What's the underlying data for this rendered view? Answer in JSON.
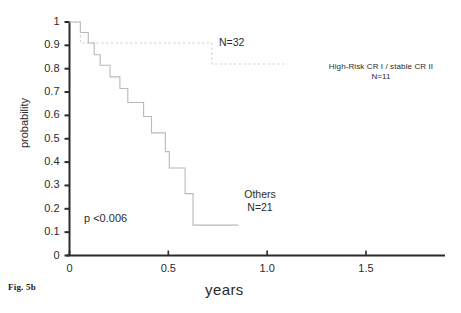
{
  "figure": {
    "caption": "Fig. 5b",
    "axes": {
      "xlabel": "years",
      "ylabel": "probability",
      "xticks": [
        "0",
        "0.5",
        "1.0",
        "1.5"
      ],
      "yticks": [
        "0",
        "0.1",
        "0.2",
        "0.3",
        "0.4",
        "0.5",
        "0.6",
        "0.7",
        "0.8",
        "0.9",
        "1"
      ]
    },
    "annotations": {
      "total_n": "N=32",
      "group_highrisk_label": "High-Risk CR I / stable CR II",
      "group_highrisk_n": "N=11",
      "group_others_label": "Others",
      "group_others_n": "N=21",
      "pvalue": "p <0.006"
    },
    "colors": {
      "axis": "#2b2b2b",
      "curve_others": "#b9b9b9",
      "curve_highrisk": "#d0d0d0",
      "rule": "#8a8a8a",
      "text": "#2b2b2b"
    }
  },
  "chart_data": {
    "type": "line",
    "subtype": "kaplan-meier-step",
    "title": "",
    "xlabel": "years",
    "ylabel": "probability",
    "xlim": [
      0,
      1.9
    ],
    "ylim": [
      0,
      1
    ],
    "grid": false,
    "legend_position": "inline-annotations",
    "xticks": [
      0,
      0.5,
      1.0,
      1.5
    ],
    "yticks": [
      0,
      0.1,
      0.2,
      0.3,
      0.4,
      0.5,
      0.6,
      0.7,
      0.8,
      0.9,
      1.0
    ],
    "pvalue": "p <0.006",
    "total_n": 32,
    "series": [
      {
        "name": "High-Risk CR I / stable CR II",
        "n": 11,
        "style": "dotted",
        "color": "#d0d0d0",
        "points": [
          [
            0.0,
            1.0
          ],
          [
            0.055,
            1.0
          ],
          [
            0.055,
            0.91
          ],
          [
            0.72,
            0.91
          ],
          [
            0.72,
            0.82
          ],
          [
            1.1,
            0.82
          ]
        ]
      },
      {
        "name": "Others",
        "n": 21,
        "style": "solid",
        "color": "#b9b9b9",
        "points": [
          [
            0.0,
            1.0
          ],
          [
            0.055,
            1.0
          ],
          [
            0.055,
            0.955
          ],
          [
            0.095,
            0.955
          ],
          [
            0.095,
            0.91
          ],
          [
            0.125,
            0.91
          ],
          [
            0.125,
            0.86
          ],
          [
            0.155,
            0.86
          ],
          [
            0.155,
            0.815
          ],
          [
            0.205,
            0.815
          ],
          [
            0.205,
            0.765
          ],
          [
            0.255,
            0.765
          ],
          [
            0.255,
            0.715
          ],
          [
            0.295,
            0.715
          ],
          [
            0.295,
            0.655
          ],
          [
            0.375,
            0.655
          ],
          [
            0.375,
            0.595
          ],
          [
            0.415,
            0.595
          ],
          [
            0.415,
            0.525
          ],
          [
            0.485,
            0.525
          ],
          [
            0.485,
            0.445
          ],
          [
            0.505,
            0.445
          ],
          [
            0.505,
            0.375
          ],
          [
            0.585,
            0.375
          ],
          [
            0.585,
            0.265
          ],
          [
            0.625,
            0.265
          ],
          [
            0.625,
            0.13
          ],
          [
            0.855,
            0.13
          ]
        ]
      }
    ]
  }
}
